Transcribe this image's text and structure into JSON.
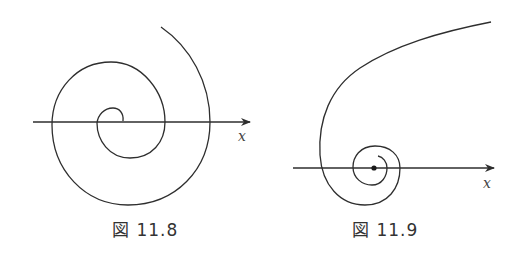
{
  "figures": [
    {
      "caption": "図 11.8",
      "axis_label": "x",
      "description": "Spiral expanding outward from origin, crossing the x-axis repeatedly (unstable focus)"
    },
    {
      "caption": "図 11.9",
      "axis_label": "x",
      "description": "Trajectory spiralling inward to a fixed point marked by a dot on the x-axis (stable focus)"
    }
  ],
  "colors": {
    "stroke": "#2e2e2e",
    "background": "#ffffff"
  }
}
